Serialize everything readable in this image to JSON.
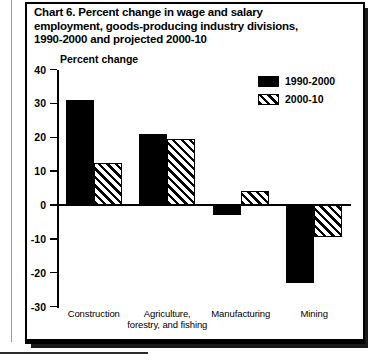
{
  "chart_data": {
    "type": "bar",
    "title": "Chart 6.  Percent change in wage and salary employment, goods-producing industry divisions, 1990-2000 and projected 2000-10",
    "title_lines": [
      "Chart 6.  Percent change in wage and salary",
      "employment, goods-producing industry divisions,",
      "1990-2000 and projected 2000-10"
    ],
    "chart_number": "Chart 6.",
    "ylabel": "Percent change",
    "xlabel": "",
    "ylim": [
      -30,
      40
    ],
    "yticks": [
      40,
      30,
      20,
      10,
      0,
      -10,
      -20,
      -30
    ],
    "ytick_labels": [
      "40",
      "30",
      "20",
      "10",
      "0",
      "-10",
      "-20",
      "-30"
    ],
    "grid": false,
    "legend_position": "top-right",
    "categories": [
      "Construction",
      "Agriculture, forestry, and fishing",
      "Manufacturing",
      "Mining"
    ],
    "category_label_lines": [
      [
        "Construction"
      ],
      [
        "Agriculture,",
        "forestry, and fishing"
      ],
      [
        "Manufacturing"
      ],
      [
        "Mining"
      ]
    ],
    "series": [
      {
        "name": "1990-2000",
        "fill": "solid",
        "color": "#000000",
        "values": [
          31,
          21,
          -3,
          -23
        ]
      },
      {
        "name": "2000-10",
        "fill": "hatch",
        "color": "#000000",
        "values": [
          12.5,
          19.5,
          4,
          -9.5
        ]
      }
    ]
  },
  "legend": {
    "items": [
      {
        "label": "1990-2000",
        "fill": "solid"
      },
      {
        "label": "2000-10",
        "fill": "hatch"
      }
    ]
  }
}
